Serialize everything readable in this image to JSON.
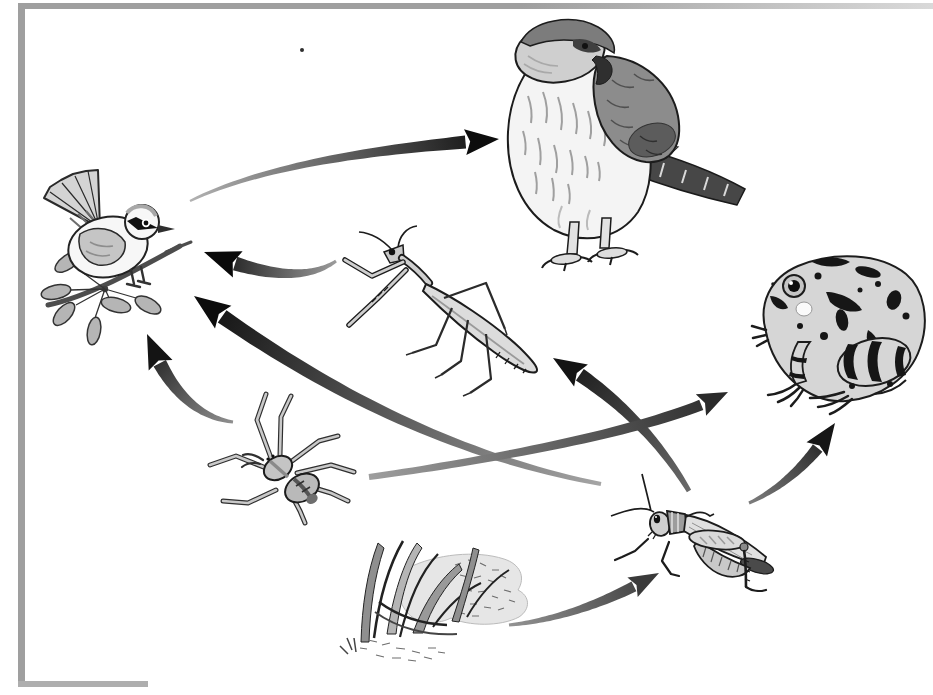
{
  "meta": {
    "kind": "food-web-diagram",
    "visible_text": "none"
  },
  "canvas": {
    "width": 933,
    "height": 695,
    "background": "#ffffff"
  },
  "frame": {
    "color": "#9f9f9f",
    "fade_color": "#d9d9d9",
    "bottom_color": "#aeaeae"
  },
  "nodes": [
    {
      "id": "songbird",
      "label": "songbird-on-branch",
      "cx": 110,
      "cy": 252
    },
    {
      "id": "hawk",
      "label": "hawk-falcon",
      "cx": 625,
      "cy": 148
    },
    {
      "id": "frog",
      "label": "spotted-frog",
      "cx": 840,
      "cy": 330
    },
    {
      "id": "mantis",
      "label": "praying-mantis",
      "cx": 448,
      "cy": 312
    },
    {
      "id": "spider",
      "label": "wolf-spider",
      "cx": 285,
      "cy": 470
    },
    {
      "id": "grasshopper",
      "label": "grasshopper",
      "cx": 700,
      "cy": 540
    },
    {
      "id": "grass",
      "label": "grass-clump",
      "cx": 435,
      "cy": 600
    }
  ],
  "edges": [
    {
      "from": "songbird",
      "to": "hawk",
      "tail": [
        190,
        201
      ],
      "control": [
        285,
        155
      ],
      "control2": [
        437,
        145
      ],
      "head": [
        499,
        139
      ],
      "tail_hw": 1.2,
      "head_hw": 6.5,
      "head_len": 34,
      "head_span": 13,
      "colors": [
        "#b2b2b2",
        "#0d0d0d"
      ]
    },
    {
      "from": "mantis",
      "to": "songbird",
      "tail": [
        336,
        261
      ],
      "control": [
        295,
        290
      ],
      "head": [
        204,
        252
      ],
      "tail_hw": 1.5,
      "head_hw": 7,
      "head_len": 36,
      "head_span": 14,
      "colors": [
        "#9b9b9b",
        "#0a0a0a"
      ]
    },
    {
      "from": "spider",
      "to": "songbird",
      "tail": [
        233,
        422
      ],
      "control": [
        176,
        414
      ],
      "head": [
        147,
        334
      ],
      "tail_hw": 1.5,
      "head_hw": 7,
      "head_len": 34,
      "head_span": 13,
      "colors": [
        "#8f8f8f",
        "#141414"
      ]
    },
    {
      "from": "grasshopper",
      "to": "songbird",
      "tail": [
        601,
        484
      ],
      "control": [
        395,
        445
      ],
      "head": [
        194,
        296
      ],
      "tail_hw": 2,
      "head_hw": 7.5,
      "head_len": 36,
      "head_span": 14,
      "colors": [
        "#a5a5a5",
        "#0d0d0d"
      ]
    },
    {
      "from": "grasshopper",
      "to": "mantis",
      "tail": [
        689,
        491
      ],
      "control": [
        640,
        408
      ],
      "head": [
        553,
        358
      ],
      "tail_hw": 2.5,
      "head_hw": 7,
      "head_len": 33,
      "head_span": 13,
      "colors": [
        "#6a6a6a",
        "#141414"
      ]
    },
    {
      "from": "spider",
      "to": "frog",
      "tail": [
        369,
        477
      ],
      "control": [
        480,
        462
      ],
      "control2": [
        668,
        428
      ],
      "head": [
        728,
        392
      ],
      "tail_hw": 3,
      "head_hw": 5.5,
      "head_len": 30,
      "head_span": 12,
      "colors": [
        "#9e9e9e",
        "#2a2a2a"
      ]
    },
    {
      "from": "grasshopper",
      "to": "frog",
      "tail": [
        749,
        503
      ],
      "control": [
        801,
        479
      ],
      "head": [
        835,
        423
      ],
      "tail_hw": 1.5,
      "head_hw": 6,
      "head_len": 32,
      "head_span": 12.5,
      "colors": [
        "#7d7d7d",
        "#161616"
      ]
    },
    {
      "from": "grass",
      "to": "grasshopper",
      "tail": [
        509,
        625
      ],
      "control": [
        580,
        618
      ],
      "head": [
        659,
        573
      ],
      "tail_hw": 1.5,
      "head_hw": 5.5,
      "head_len": 30,
      "head_span": 11,
      "colors": [
        "#939393",
        "#3a3a3a"
      ]
    }
  ],
  "artifacts": {
    "ink_speck": {
      "x": 302,
      "y": 50,
      "r": 2,
      "color": "#2f2f2f"
    }
  }
}
